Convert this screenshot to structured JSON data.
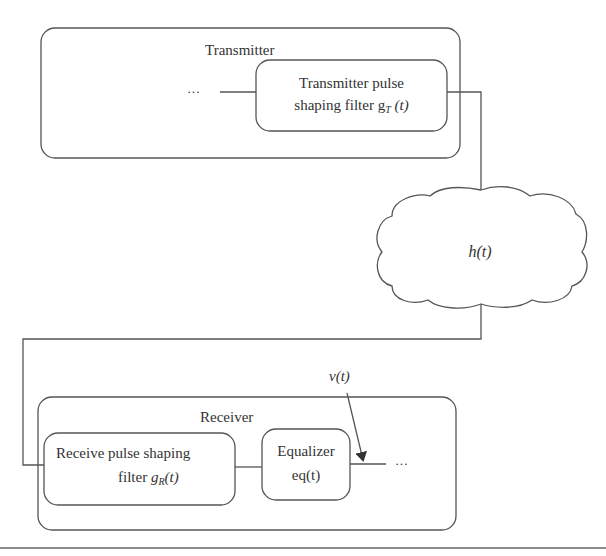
{
  "diagram": {
    "transmitter": {
      "title": "Transmitter",
      "input_ellipsis": "···",
      "filter": {
        "line1": "Transmitter pulse",
        "line2_prefix": "shaping filter g",
        "line2_sub": "T",
        "line2_suffix": " (t)"
      }
    },
    "channel": {
      "label": "h(t)"
    },
    "receiver": {
      "title": "Receiver",
      "filter": {
        "line1": "Receive pulse shaping",
        "line2_prefix": "filter ",
        "line2_var": "g",
        "line2_sub": "R",
        "line2_suffix": "(t)"
      },
      "equalizer": {
        "line1": "Equalizer",
        "line2": "eq(t)"
      },
      "noise_label": "ν(t)",
      "output_ellipsis": "···"
    },
    "colors": {
      "stroke": "#555555",
      "text": "#333333",
      "background": "#ffffff"
    }
  }
}
